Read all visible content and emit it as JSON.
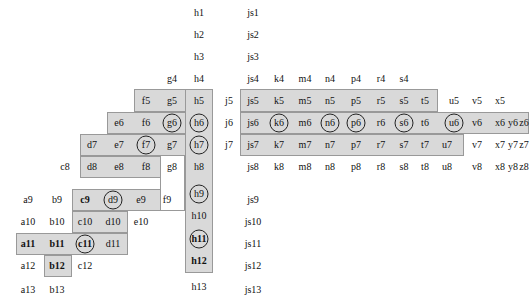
{
  "figure": {
    "title": "",
    "canvas": {
      "width": 530,
      "height": 302,
      "background": "#ffffff"
    },
    "region_fill": "#d9d9d9",
    "region_stroke": "#999999",
    "hole_fill": "#ffffff",
    "marker_stroke": "#222222",
    "label_color": "#111111"
  },
  "chart_data": {
    "type": "table",
    "title": "",
    "xlabel": "",
    "ylabel": "",
    "row_indices": [
      1,
      2,
      3,
      4,
      5,
      6,
      7,
      8,
      9,
      10,
      11,
      12,
      13
    ],
    "column_letters_left": [
      "a",
      "b",
      "c",
      "d",
      "e",
      "f",
      "g",
      "h"
    ],
    "column_letters_right": [
      "j",
      "js",
      "k",
      "m",
      "n",
      "p",
      "r",
      "s",
      "t",
      "u",
      "v",
      "x",
      "y",
      "z"
    ],
    "cells": [
      {
        "label": "h1",
        "x": 199,
        "y": 13,
        "shaded": false,
        "circled": false,
        "bold": false
      },
      {
        "label": "js1",
        "x": 253,
        "y": 13,
        "shaded": false,
        "circled": false,
        "bold": false
      },
      {
        "label": "h2",
        "x": 199,
        "y": 35,
        "shaded": false,
        "circled": false,
        "bold": false
      },
      {
        "label": "js2",
        "x": 253,
        "y": 35,
        "shaded": false,
        "circled": false,
        "bold": false
      },
      {
        "label": "h3",
        "x": 199,
        "y": 57,
        "shaded": false,
        "circled": false,
        "bold": false
      },
      {
        "label": "js3",
        "x": 253,
        "y": 57,
        "shaded": false,
        "circled": false,
        "bold": false
      },
      {
        "label": "g4",
        "x": 172,
        "y": 79,
        "shaded": false,
        "circled": false,
        "bold": false
      },
      {
        "label": "h4",
        "x": 199,
        "y": 79,
        "shaded": false,
        "circled": false,
        "bold": false
      },
      {
        "label": "js4",
        "x": 253,
        "y": 79,
        "shaded": false,
        "circled": false,
        "bold": false
      },
      {
        "label": "k4",
        "x": 279,
        "y": 79,
        "shaded": false,
        "circled": false,
        "bold": false
      },
      {
        "label": "m4",
        "x": 305,
        "y": 79,
        "shaded": false,
        "circled": false,
        "bold": false
      },
      {
        "label": "n4",
        "x": 330,
        "y": 79,
        "shaded": false,
        "circled": false,
        "bold": false
      },
      {
        "label": "p4",
        "x": 356,
        "y": 79,
        "shaded": false,
        "circled": false,
        "bold": false
      },
      {
        "label": "r4",
        "x": 381,
        "y": 79,
        "shaded": false,
        "circled": false,
        "bold": false
      },
      {
        "label": "s4",
        "x": 404,
        "y": 79,
        "shaded": false,
        "circled": false,
        "bold": false
      },
      {
        "label": "f5",
        "x": 146,
        "y": 101,
        "shaded": true,
        "circled": false,
        "bold": false
      },
      {
        "label": "g5",
        "x": 172,
        "y": 101,
        "shaded": true,
        "circled": false,
        "bold": false
      },
      {
        "label": "h5",
        "x": 199,
        "y": 101,
        "shaded": true,
        "circled": false,
        "bold": false
      },
      {
        "label": "j5",
        "x": 229,
        "y": 101,
        "shaded": false,
        "circled": false,
        "bold": false
      },
      {
        "label": "js5",
        "x": 253,
        "y": 101,
        "shaded": true,
        "circled": false,
        "bold": false
      },
      {
        "label": "k5",
        "x": 279,
        "y": 101,
        "shaded": true,
        "circled": false,
        "bold": false
      },
      {
        "label": "m5",
        "x": 305,
        "y": 101,
        "shaded": true,
        "circled": false,
        "bold": false
      },
      {
        "label": "n5",
        "x": 330,
        "y": 101,
        "shaded": true,
        "circled": false,
        "bold": false
      },
      {
        "label": "p5",
        "x": 356,
        "y": 101,
        "shaded": true,
        "circled": false,
        "bold": false
      },
      {
        "label": "r5",
        "x": 381,
        "y": 101,
        "shaded": true,
        "circled": false,
        "bold": false
      },
      {
        "label": "s5",
        "x": 404,
        "y": 101,
        "shaded": true,
        "circled": false,
        "bold": false
      },
      {
        "label": "t5",
        "x": 425,
        "y": 101,
        "shaded": true,
        "circled": false,
        "bold": false
      },
      {
        "label": "u5",
        "x": 454,
        "y": 101,
        "shaded": false,
        "circled": false,
        "bold": false
      },
      {
        "label": "v5",
        "x": 477,
        "y": 101,
        "shaded": false,
        "circled": false,
        "bold": false
      },
      {
        "label": "x5",
        "x": 500,
        "y": 101,
        "shaded": false,
        "circled": false,
        "bold": false
      },
      {
        "label": "e6",
        "x": 119,
        "y": 123,
        "shaded": false,
        "circled": false,
        "bold": false
      },
      {
        "label": "f6",
        "x": 146,
        "y": 123,
        "shaded": true,
        "circled": false,
        "bold": false
      },
      {
        "label": "g6",
        "x": 172,
        "y": 123,
        "shaded": true,
        "circled": true,
        "bold": false
      },
      {
        "label": "h6",
        "x": 199,
        "y": 123,
        "shaded": true,
        "circled": true,
        "bold": false
      },
      {
        "label": "j6",
        "x": 229,
        "y": 123,
        "shaded": false,
        "circled": false,
        "bold": false
      },
      {
        "label": "js6",
        "x": 253,
        "y": 123,
        "shaded": true,
        "circled": false,
        "bold": false
      },
      {
        "label": "k6",
        "x": 279,
        "y": 123,
        "shaded": true,
        "circled": true,
        "bold": false
      },
      {
        "label": "m6",
        "x": 305,
        "y": 123,
        "shaded": true,
        "circled": false,
        "bold": false
      },
      {
        "label": "n6",
        "x": 330,
        "y": 123,
        "shaded": true,
        "circled": true,
        "bold": false
      },
      {
        "label": "p6",
        "x": 356,
        "y": 123,
        "shaded": true,
        "circled": true,
        "bold": false
      },
      {
        "label": "r6",
        "x": 381,
        "y": 123,
        "shaded": true,
        "circled": false,
        "bold": false
      },
      {
        "label": "s6",
        "x": 404,
        "y": 123,
        "shaded": true,
        "circled": true,
        "bold": false
      },
      {
        "label": "t6",
        "x": 425,
        "y": 123,
        "shaded": true,
        "circled": false,
        "bold": false
      },
      {
        "label": "u6",
        "x": 454,
        "y": 123,
        "shaded": true,
        "circled": true,
        "bold": false
      },
      {
        "label": "v6",
        "x": 477,
        "y": 123,
        "shaded": true,
        "circled": false,
        "bold": false
      },
      {
        "label": "x6",
        "x": 500,
        "y": 123,
        "shaded": true,
        "circled": false,
        "bold": false
      },
      {
        "label": "y6",
        "x": 513,
        "y": 123,
        "shaded": true,
        "circled": false,
        "bold": false
      },
      {
        "label": "z6",
        "x": 524,
        "y": 123,
        "shaded": true,
        "circled": false,
        "bold": false
      },
      {
        "label": "d7",
        "x": 92,
        "y": 145,
        "shaded": false,
        "circled": false,
        "bold": false
      },
      {
        "label": "e7",
        "x": 119,
        "y": 145,
        "shaded": true,
        "circled": false,
        "bold": false
      },
      {
        "label": "f7",
        "x": 146,
        "y": 145,
        "shaded": true,
        "circled": true,
        "bold": false
      },
      {
        "label": "g7",
        "x": 172,
        "y": 145,
        "shaded": true,
        "circled": false,
        "bold": false
      },
      {
        "label": "h7",
        "x": 199,
        "y": 145,
        "shaded": true,
        "circled": true,
        "bold": false
      },
      {
        "label": "j7",
        "x": 229,
        "y": 145,
        "shaded": false,
        "circled": false,
        "bold": false
      },
      {
        "label": "js7",
        "x": 253,
        "y": 145,
        "shaded": true,
        "circled": false,
        "bold": false
      },
      {
        "label": "k7",
        "x": 279,
        "y": 145,
        "shaded": true,
        "circled": false,
        "bold": false
      },
      {
        "label": "m7",
        "x": 305,
        "y": 145,
        "shaded": true,
        "circled": false,
        "bold": false
      },
      {
        "label": "n7",
        "x": 330,
        "y": 145,
        "shaded": true,
        "circled": false,
        "bold": false
      },
      {
        "label": "p7",
        "x": 356,
        "y": 145,
        "shaded": true,
        "circled": false,
        "bold": false
      },
      {
        "label": "r7",
        "x": 381,
        "y": 145,
        "shaded": true,
        "circled": false,
        "bold": false
      },
      {
        "label": "s7",
        "x": 404,
        "y": 145,
        "shaded": true,
        "circled": false,
        "bold": false
      },
      {
        "label": "t7",
        "x": 425,
        "y": 145,
        "shaded": true,
        "circled": false,
        "bold": false
      },
      {
        "label": "u7",
        "x": 447,
        "y": 145,
        "shaded": true,
        "circled": false,
        "bold": false
      },
      {
        "label": "v7",
        "x": 477,
        "y": 145,
        "shaded": false,
        "circled": false,
        "bold": false
      },
      {
        "label": "x7",
        "x": 500,
        "y": 145,
        "shaded": false,
        "circled": false,
        "bold": false
      },
      {
        "label": "y7",
        "x": 513,
        "y": 145,
        "shaded": false,
        "circled": false,
        "bold": false
      },
      {
        "label": "z7",
        "x": 524,
        "y": 145,
        "shaded": false,
        "circled": false,
        "bold": false
      },
      {
        "label": "c8",
        "x": 65,
        "y": 167,
        "shaded": false,
        "circled": false,
        "bold": false
      },
      {
        "label": "d8",
        "x": 92,
        "y": 167,
        "shaded": true,
        "circled": false,
        "bold": false
      },
      {
        "label": "e8",
        "x": 119,
        "y": 167,
        "shaded": true,
        "circled": false,
        "bold": false
      },
      {
        "label": "f8",
        "x": 146,
        "y": 167,
        "shaded": true,
        "circled": false,
        "bold": false
      },
      {
        "label": "g8",
        "x": 172,
        "y": 167,
        "shaded": false,
        "circled": false,
        "bold": false
      },
      {
        "label": "h8",
        "x": 199,
        "y": 167,
        "shaded": true,
        "circled": false,
        "bold": false
      },
      {
        "label": "js8",
        "x": 253,
        "y": 167,
        "shaded": false,
        "circled": false,
        "bold": false
      },
      {
        "label": "k8",
        "x": 279,
        "y": 167,
        "shaded": false,
        "circled": false,
        "bold": false
      },
      {
        "label": "m8",
        "x": 305,
        "y": 167,
        "shaded": false,
        "circled": false,
        "bold": false
      },
      {
        "label": "n8",
        "x": 330,
        "y": 167,
        "shaded": false,
        "circled": false,
        "bold": false
      },
      {
        "label": "p8",
        "x": 356,
        "y": 167,
        "shaded": false,
        "circled": false,
        "bold": false
      },
      {
        "label": "r8",
        "x": 381,
        "y": 167,
        "shaded": false,
        "circled": false,
        "bold": false
      },
      {
        "label": "s8",
        "x": 404,
        "y": 167,
        "shaded": false,
        "circled": false,
        "bold": false
      },
      {
        "label": "t8",
        "x": 425,
        "y": 167,
        "shaded": false,
        "circled": false,
        "bold": false
      },
      {
        "label": "u8",
        "x": 447,
        "y": 167,
        "shaded": false,
        "circled": false,
        "bold": false
      },
      {
        "label": "v8",
        "x": 477,
        "y": 167,
        "shaded": false,
        "circled": false,
        "bold": false
      },
      {
        "label": "x8",
        "x": 500,
        "y": 167,
        "shaded": false,
        "circled": false,
        "bold": false
      },
      {
        "label": "y8",
        "x": 513,
        "y": 167,
        "shaded": false,
        "circled": false,
        "bold": false
      },
      {
        "label": "z8",
        "x": 524,
        "y": 167,
        "shaded": false,
        "circled": false,
        "bold": false
      },
      {
        "label": "a9",
        "x": 28,
        "y": 200,
        "shaded": false,
        "circled": false,
        "bold": false
      },
      {
        "label": "b9",
        "x": 57,
        "y": 200,
        "shaded": false,
        "circled": false,
        "bold": false
      },
      {
        "label": "c9",
        "x": 85,
        "y": 200,
        "shaded": true,
        "circled": false,
        "bold": true
      },
      {
        "label": "d9",
        "x": 113,
        "y": 200,
        "shaded": true,
        "circled": true,
        "bold": false
      },
      {
        "label": "e9",
        "x": 141,
        "y": 200,
        "shaded": true,
        "circled": false,
        "bold": false
      },
      {
        "label": "f9",
        "x": 167,
        "y": 200,
        "shaded": true,
        "circled": false,
        "bold": false
      },
      {
        "label": "h9",
        "x": 199,
        "y": 194,
        "shaded": true,
        "circled": true,
        "bold": false
      },
      {
        "label": "js9",
        "x": 253,
        "y": 200,
        "shaded": false,
        "circled": false,
        "bold": false
      },
      {
        "label": "a10",
        "x": 28,
        "y": 222,
        "shaded": false,
        "circled": false,
        "bold": false
      },
      {
        "label": "b10",
        "x": 57,
        "y": 222,
        "shaded": false,
        "circled": false,
        "bold": false
      },
      {
        "label": "c10",
        "x": 85,
        "y": 222,
        "shaded": true,
        "circled": false,
        "bold": false
      },
      {
        "label": "d10",
        "x": 113,
        "y": 222,
        "shaded": true,
        "circled": false,
        "bold": false
      },
      {
        "label": "e10",
        "x": 141,
        "y": 222,
        "shaded": false,
        "circled": false,
        "bold": false
      },
      {
        "label": "h10",
        "x": 199,
        "y": 216,
        "shaded": true,
        "circled": false,
        "bold": false
      },
      {
        "label": "js10",
        "x": 253,
        "y": 222,
        "shaded": false,
        "circled": false,
        "bold": false
      },
      {
        "label": "a11",
        "x": 28,
        "y": 244,
        "shaded": true,
        "circled": false,
        "bold": true
      },
      {
        "label": "b11",
        "x": 57,
        "y": 244,
        "shaded": true,
        "circled": false,
        "bold": true
      },
      {
        "label": "c11",
        "x": 85,
        "y": 244,
        "shaded": true,
        "circled": true,
        "bold": true
      },
      {
        "label": "d11",
        "x": 113,
        "y": 244,
        "shaded": true,
        "circled": false,
        "bold": false
      },
      {
        "label": "h11",
        "x": 199,
        "y": 239,
        "shaded": true,
        "circled": true,
        "bold": true
      },
      {
        "label": "js11",
        "x": 253,
        "y": 244,
        "shaded": false,
        "circled": false,
        "bold": false
      },
      {
        "label": "a12",
        "x": 28,
        "y": 266,
        "shaded": false,
        "circled": false,
        "bold": false
      },
      {
        "label": "b12",
        "x": 57,
        "y": 266,
        "shaded": true,
        "circled": false,
        "bold": true
      },
      {
        "label": "c12",
        "x": 85,
        "y": 266,
        "shaded": false,
        "circled": false,
        "bold": false
      },
      {
        "label": "h12",
        "x": 199,
        "y": 261,
        "shaded": true,
        "circled": false,
        "bold": true
      },
      {
        "label": "js12",
        "x": 253,
        "y": 266,
        "shaded": false,
        "circled": false,
        "bold": false
      },
      {
        "label": "a13",
        "x": 28,
        "y": 290,
        "shaded": false,
        "circled": false,
        "bold": false
      },
      {
        "label": "b13",
        "x": 57,
        "y": 290,
        "shaded": false,
        "circled": false,
        "bold": false
      },
      {
        "label": "h13",
        "x": 199,
        "y": 287,
        "shaded": false,
        "circled": false,
        "bold": false
      },
      {
        "label": "js13",
        "x": 253,
        "y": 290,
        "shaded": false,
        "circled": false,
        "bold": false
      }
    ],
    "regions": [
      {
        "name": "left-staircase-region",
        "rects": [
          {
            "x": 134,
            "y": 89,
            "w": 79,
            "h": 23
          },
          {
            "x": 107,
            "y": 112,
            "w": 106,
            "h": 22
          },
          {
            "x": 80,
            "y": 134,
            "w": 133,
            "h": 22
          },
          {
            "x": 80,
            "y": 156,
            "w": 133,
            "h": 22
          },
          {
            "x": 72,
            "y": 189,
            "w": 112,
            "h": 22
          },
          {
            "x": 72,
            "y": 211,
            "w": 56,
            "h": 22
          },
          {
            "x": 16,
            "y": 233,
            "w": 112,
            "h": 22
          },
          {
            "x": 44,
            "y": 255,
            "w": 28,
            "h": 22
          }
        ],
        "holes": [
          {
            "x": 160,
            "y": 156,
            "w": 25,
            "h": 55
          }
        ]
      },
      {
        "name": "h-column-region",
        "rects": [
          {
            "x": 185,
            "y": 89,
            "w": 28,
            "h": 184
          }
        ],
        "holes": []
      },
      {
        "name": "right-region",
        "rects": [
          {
            "x": 240,
            "y": 89,
            "w": 198,
            "h": 23
          },
          {
            "x": 240,
            "y": 112,
            "w": 289,
            "h": 22
          },
          {
            "x": 240,
            "y": 134,
            "w": 224,
            "h": 22
          }
        ],
        "holes": []
      }
    ]
  }
}
